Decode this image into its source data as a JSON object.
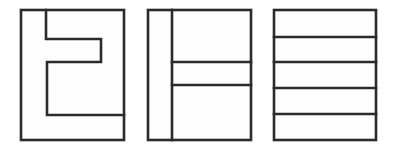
{
  "canvas": {
    "width": 395,
    "height": 150,
    "background_color": "#ffffff",
    "description": "Three black-outlined rectangular line-drawing figures arranged side by side on a white background"
  },
  "style": {
    "stroke_color": "#2b2b2b",
    "fill_color": "#fdfdfd",
    "stroke_width": 2.6
  },
  "figures": [
    {
      "id": "figure-1",
      "label": "figure-1",
      "name": "notched-block-figure",
      "description": "Outer rectangle with an inset step/notch polygon forming a reversed C or bracket shape in the upper-left interior",
      "bounds": {
        "x": 21,
        "y": 10,
        "width": 103,
        "height": 130
      },
      "outer_rect": {
        "x": 21,
        "y": 10,
        "width": 103,
        "height": 130
      },
      "inner_polygon_points": "46,10 46,39 101,39 101,62 47,62 47,115 124,115",
      "interior_lines": []
    },
    {
      "id": "figure-2",
      "label": "figure-2",
      "name": "rotated-h-figure",
      "description": "Outer rectangle divided by a vertical line near the left with two horizontal lines creating a sideways H pattern",
      "bounds": {
        "x": 148,
        "y": 10,
        "width": 103,
        "height": 130
      },
      "outer_rect": {
        "x": 148,
        "y": 10,
        "width": 103,
        "height": 130
      },
      "vertical_divider": {
        "x": 172,
        "y1": 10,
        "y2": 140
      },
      "interior_lines": [
        {
          "x1": 172,
          "y1": 62,
          "x2": 251,
          "y2": 62
        },
        {
          "x1": 172,
          "y1": 85,
          "x2": 251,
          "y2": 85
        }
      ]
    },
    {
      "id": "figure-3",
      "label": "figure-3",
      "name": "striped-bands-figure",
      "description": "Outer rectangle divided by four evenly spaced horizontal lines into five horizontal bands",
      "bounds": {
        "x": 274,
        "y": 10,
        "width": 102,
        "height": 130
      },
      "outer_rect": {
        "x": 274,
        "y": 10,
        "width": 102,
        "height": 130
      },
      "band_count": 5,
      "interior_lines": [
        {
          "x1": 274,
          "y1": 37,
          "x2": 376,
          "y2": 37
        },
        {
          "x1": 274,
          "y1": 62,
          "x2": 376,
          "y2": 62
        },
        {
          "x1": 274,
          "y1": 88,
          "x2": 376,
          "y2": 88
        },
        {
          "x1": 274,
          "y1": 114,
          "x2": 376,
          "y2": 114
        }
      ]
    }
  ]
}
